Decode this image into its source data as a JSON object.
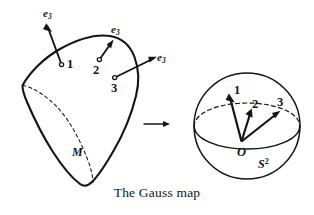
{
  "figure": {
    "caption": "The Gauss map",
    "surface": {
      "label": "M",
      "points": [
        {
          "number": "1",
          "normal_label_e": "e",
          "normal_label_sub": "3"
        },
        {
          "number": "2",
          "normal_label_e": "e",
          "normal_label_sub": "3"
        },
        {
          "number": "3",
          "normal_label_e": "e",
          "normal_label_sub": "3"
        }
      ]
    },
    "sphere": {
      "label_base": "S",
      "label_exponent": "2",
      "origin_label": "O",
      "vectors": [
        {
          "number": "1"
        },
        {
          "number": "2"
        },
        {
          "number": "3"
        }
      ]
    },
    "mapping_arrow": {
      "name": "gauss-map-arrow"
    },
    "colors": {
      "ink": "#141414",
      "background": "#ffffff"
    }
  }
}
